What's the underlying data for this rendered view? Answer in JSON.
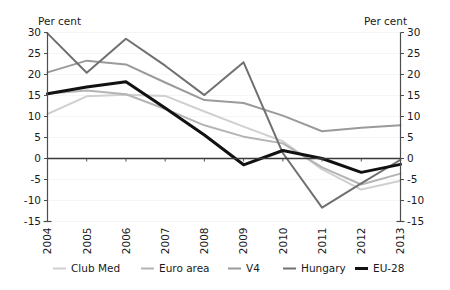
{
  "chart_data": {
    "type": "line",
    "title": "",
    "subtitle": "",
    "xlabel": "",
    "ylabel": "Per cent",
    "ylabel_right": "Per cent",
    "categories": [
      "2004",
      "2005",
      "2006",
      "2007",
      "2008",
      "2009",
      "2010",
      "2011",
      "2012",
      "2013"
    ],
    "x": [
      2004,
      2005,
      2006,
      2007,
      2008,
      2009,
      2010,
      2011,
      2012,
      2013
    ],
    "ylim": [
      -15,
      30
    ],
    "yticks": [
      -15,
      -10,
      -5,
      0,
      5,
      10,
      15,
      20,
      25,
      30
    ],
    "ytick_labels": [
      "-15",
      "-10",
      "-5",
      "0",
      "5",
      "10",
      "15",
      "20",
      "25",
      "30"
    ],
    "ytick_labels_right": [
      "-15",
      "-10",
      "-5",
      "0",
      "5",
      "10",
      "15",
      "20",
      "25",
      "30"
    ],
    "grid": true,
    "legend_position": "bottom",
    "series": [
      {
        "name": "Club Med",
        "color": "#d0d0d0",
        "width": 2.0,
        "values": [
          10.6,
          14.8,
          15.2,
          14.9,
          11.2,
          7.6,
          4.1,
          -2.6,
          -7.4,
          -5.3
        ]
      },
      {
        "name": "Euro area",
        "color": "#b4b4b4",
        "width": 2.0,
        "values": [
          15.4,
          16.2,
          15.3,
          11.8,
          7.9,
          5.2,
          3.6,
          -2.1,
          -6.2,
          -3.6
        ]
      },
      {
        "name": "V4",
        "color": "#9a9a9a",
        "width": 2.0,
        "values": [
          20.5,
          23.3,
          22.4,
          18.1,
          13.9,
          13.2,
          10.2,
          6.5,
          7.3,
          7.9
        ]
      },
      {
        "name": "Hungary",
        "color": "#707070",
        "width": 2.0,
        "values": [
          29.8,
          20.4,
          28.5,
          22.1,
          15.1,
          22.9,
          1.3,
          -11.7,
          -5.9,
          -0.3
        ]
      },
      {
        "name": "EU-28",
        "color": "#111111",
        "width": 3.0,
        "values": [
          15.4,
          17.0,
          18.3,
          12.0,
          5.6,
          -1.5,
          1.9,
          0.0,
          -3.3,
          -1.4
        ]
      }
    ]
  },
  "legend": {
    "items": [
      {
        "label": "Club Med"
      },
      {
        "label": "Euro area"
      },
      {
        "label": "V4"
      },
      {
        "label": "Hungary"
      },
      {
        "label": "EU-28"
      }
    ]
  },
  "axes": {
    "left_unit": "Per cent",
    "right_unit": "Per cent"
  }
}
